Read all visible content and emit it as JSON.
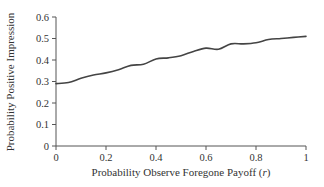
{
  "chart_data": {
    "type": "line",
    "title": "",
    "xlabel": "Probability Observe Foregone Payoff (r)",
    "xlabel_main": "Probability Observe Foregone Payoff (",
    "xlabel_var": "r",
    "xlabel_close": ")",
    "ylabel": "Probability Positive Impression",
    "xlim": [
      0,
      1
    ],
    "ylim": [
      0,
      0.6
    ],
    "grid": false,
    "legend": null,
    "x_ticks": [
      0,
      0.2,
      0.4,
      0.6,
      0.8,
      1
    ],
    "x_tick_labels": [
      "0",
      "0.2",
      "0.4",
      "0.6",
      "0.8",
      "1"
    ],
    "y_ticks": [
      0,
      0.1,
      0.2,
      0.3,
      0.4,
      0.5,
      0.6
    ],
    "y_tick_labels": [
      "0",
      "0.1",
      "0.2",
      "0.3",
      "0.4",
      "0.5",
      "0.6"
    ],
    "series": [
      {
        "name": "Probability Positive Impression",
        "color": "#444444",
        "x": [
          0,
          0.05,
          0.1,
          0.15,
          0.2,
          0.25,
          0.3,
          0.35,
          0.4,
          0.45,
          0.5,
          0.55,
          0.6,
          0.65,
          0.7,
          0.75,
          0.8,
          0.85,
          0.9,
          0.95,
          1.0
        ],
        "values": [
          0.29,
          0.295,
          0.315,
          0.33,
          0.34,
          0.355,
          0.375,
          0.38,
          0.405,
          0.41,
          0.42,
          0.44,
          0.455,
          0.45,
          0.475,
          0.475,
          0.48,
          0.495,
          0.5,
          0.505,
          0.51
        ]
      }
    ]
  }
}
